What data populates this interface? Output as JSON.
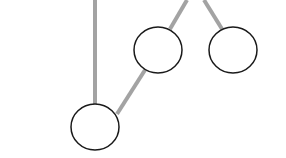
{
  "diagram": {
    "type": "tree",
    "colors": {
      "edge": "#a3a3a3",
      "node_stroke": "#1a1a1a",
      "node_fill": "#ffffff",
      "background": "#ffffff"
    },
    "nodes": [
      {
        "id": "node-a",
        "cx": 95,
        "cy": 127,
        "rx": 24,
        "ry": 23,
        "label": ""
      },
      {
        "id": "node-b",
        "cx": 158,
        "cy": 50,
        "rx": 24,
        "ry": 23,
        "label": ""
      },
      {
        "id": "node-c",
        "cx": 233,
        "cy": 50,
        "rx": 24,
        "ry": 23,
        "label": ""
      }
    ],
    "edges": [
      {
        "id": "edge-top-to-a",
        "x1": 95,
        "y1": 0,
        "x2": 95,
        "y2": 104
      },
      {
        "id": "edge-a-to-b",
        "x1": 117,
        "y1": 114,
        "x2": 145,
        "y2": 70
      },
      {
        "id": "edge-top-to-b",
        "x1": 187,
        "y1": 0,
        "x2": 170,
        "y2": 29
      },
      {
        "id": "edge-top-to-c",
        "x1": 204,
        "y1": 0,
        "x2": 222,
        "y2": 29
      }
    ]
  }
}
